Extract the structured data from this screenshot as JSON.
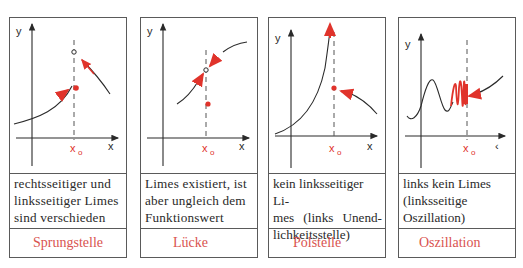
{
  "colors": {
    "accent_red": "#e0332b",
    "label_red": "#d9534f",
    "ink": "#2a2a2a",
    "border": "#5a5a5a"
  },
  "axes": {
    "y_label": "y",
    "x_label": "x",
    "x0_label": "x",
    "x0_sub": "o"
  },
  "panels": [
    {
      "description_lines": [
        "rechtsseitiger und",
        "linksseitiger Limes",
        "sind verschieden"
      ],
      "label": "Sprungstelle",
      "x_axis_label": "x"
    },
    {
      "description_lines": [
        "Limes existiert, ist",
        "aber ungleich dem",
        "Funktionswert"
      ],
      "label": "Lücke",
      "x_axis_label": "x"
    },
    {
      "description_lines": [
        "kein linksseitiger Li-",
        "mes (links Unend-",
        "lichkeitsstelle)"
      ],
      "label": "Polstelle",
      "x_axis_label": "x"
    },
    {
      "description_lines": [
        "links kein Limes",
        "(linksseitige",
        "Oszillation)"
      ],
      "label": "Oszillation",
      "x_axis_label": "‹"
    }
  ]
}
